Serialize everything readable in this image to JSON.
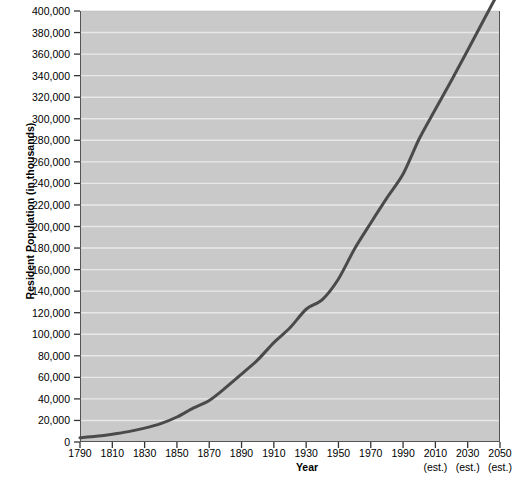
{
  "chart_data": {
    "type": "line",
    "title": "",
    "xlabel": "Year",
    "ylabel": "Resident Population (in thousands)",
    "xlim": [
      1790,
      2050
    ],
    "ylim": [
      0,
      400000
    ],
    "grid": true,
    "legend": "none",
    "line_color": "#4a4a4a",
    "plot_background": "#c9c9c9",
    "gridline_color": "#e8e8e8",
    "axis_color": "#555555",
    "x_ticks": [
      {
        "value": 1790,
        "label": "1790",
        "note": ""
      },
      {
        "value": 1810,
        "label": "1810",
        "note": ""
      },
      {
        "value": 1830,
        "label": "1830",
        "note": ""
      },
      {
        "value": 1850,
        "label": "1850",
        "note": ""
      },
      {
        "value": 1870,
        "label": "1870",
        "note": ""
      },
      {
        "value": 1890,
        "label": "1890",
        "note": ""
      },
      {
        "value": 1910,
        "label": "1910",
        "note": ""
      },
      {
        "value": 1930,
        "label": "1930",
        "note": ""
      },
      {
        "value": 1950,
        "label": "1950",
        "note": ""
      },
      {
        "value": 1970,
        "label": "1970",
        "note": ""
      },
      {
        "value": 1990,
        "label": "1990",
        "note": ""
      },
      {
        "value": 2010,
        "label": "2010",
        "note": "(est.)"
      },
      {
        "value": 2030,
        "label": "2030",
        "note": "(est.)"
      },
      {
        "value": 2050,
        "label": "2050",
        "note": "(est.)"
      }
    ],
    "y_ticks": [
      {
        "value": 0,
        "label": "0"
      },
      {
        "value": 20000,
        "label": "20,000"
      },
      {
        "value": 40000,
        "label": "40,000"
      },
      {
        "value": 60000,
        "label": "60,000"
      },
      {
        "value": 80000,
        "label": "80,000"
      },
      {
        "value": 100000,
        "label": "100,000"
      },
      {
        "value": 120000,
        "label": "120,000"
      },
      {
        "value": 140000,
        "label": "140,000"
      },
      {
        "value": 160000,
        "label": "160,000"
      },
      {
        "value": 180000,
        "label": "180,000"
      },
      {
        "value": 200000,
        "label": "200,000"
      },
      {
        "value": 220000,
        "label": "220,000"
      },
      {
        "value": 240000,
        "label": "240,000"
      },
      {
        "value": 260000,
        "label": "260,000"
      },
      {
        "value": 280000,
        "label": "280,000"
      },
      {
        "value": 300000,
        "label": "300,000"
      },
      {
        "value": 320000,
        "label": "320,000"
      },
      {
        "value": 340000,
        "label": "340,000"
      },
      {
        "value": 360000,
        "label": "360,000"
      },
      {
        "value": 380000,
        "label": "380,000"
      },
      {
        "value": 400000,
        "label": "400,000"
      }
    ],
    "x": [
      1790,
      1800,
      1810,
      1820,
      1830,
      1840,
      1850,
      1860,
      1870,
      1880,
      1890,
      1900,
      1910,
      1920,
      1930,
      1940,
      1950,
      1960,
      1970,
      1980,
      1990,
      2000,
      2010,
      2020,
      2030,
      2040,
      2050
    ],
    "series": [
      {
        "name": "Resident Population",
        "values": [
          3929,
          5308,
          7240,
          9638,
          12866,
          17069,
          23192,
          31443,
          38558,
          50189,
          62980,
          76212,
          92228,
          106022,
          123203,
          132165,
          151326,
          179323,
          203302,
          226542,
          248710,
          281422,
          308746,
          335805,
          363584,
          391946,
          419854
        ]
      }
    ]
  }
}
